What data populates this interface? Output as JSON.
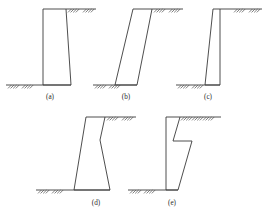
{
  "figure": {
    "background_color": "#ffffff",
    "line_color": "#3a3a3a",
    "hatch_color": "#555555",
    "width": 270,
    "height": 213,
    "panels": [
      {
        "id": "a",
        "label": "(a)",
        "label_x": 50,
        "label_y": 99,
        "description": "Vertical back face with slightly battered front face",
        "wall_points": "43,9 66,9 71,85 43,85",
        "ground_lines": [
          {
            "name": "base-ground-line",
            "x1": 6,
            "y1": 85,
            "x2": 71,
            "y2": 85
          },
          {
            "name": "top-ground-line",
            "x1": 66,
            "y1": 9,
            "x2": 96,
            "y2": 9
          }
        ],
        "hatch_groups": [
          {
            "name": "base-hatch-left",
            "x": 8,
            "y": 85,
            "count": 4,
            "spacing": 2.6,
            "length": 3.4
          },
          {
            "name": "base-hatch-right",
            "x": 22,
            "y": 85,
            "count": 4,
            "spacing": 2.6,
            "length": 3.4
          },
          {
            "name": "top-hatch-left",
            "x": 68,
            "y": 9,
            "count": 4,
            "spacing": 2.6,
            "length": 3.4
          },
          {
            "name": "top-hatch-right",
            "x": 83,
            "y": 9,
            "count": 4,
            "spacing": 2.6,
            "length": 3.4
          }
        ]
      },
      {
        "id": "b",
        "label": "(b)",
        "label_x": 126,
        "label_y": 99,
        "description": "Strongly inclined parallelogram wall leaning forward",
        "wall_points": "133,9 152,9 137,85 115,85",
        "ground_lines": [
          {
            "name": "base-ground-line",
            "x1": 93,
            "y1": 85,
            "x2": 137,
            "y2": 85
          },
          {
            "name": "top-ground-line",
            "x1": 152,
            "y1": 9,
            "x2": 183,
            "y2": 9
          }
        ],
        "hatch_groups": [
          {
            "name": "base-hatch-left",
            "x": 95,
            "y": 85,
            "count": 4,
            "spacing": 2.6,
            "length": 3.4
          },
          {
            "name": "base-hatch-right",
            "x": 109,
            "y": 85,
            "count": 4,
            "spacing": 2.6,
            "length": 3.4
          },
          {
            "name": "top-hatch-left",
            "x": 154,
            "y": 9,
            "count": 4,
            "spacing": 2.6,
            "length": 3.4
          },
          {
            "name": "top-hatch-right",
            "x": 169,
            "y": 9,
            "count": 4,
            "spacing": 2.6,
            "length": 3.4
          }
        ]
      },
      {
        "id": "c",
        "label": "(c)",
        "label_x": 208,
        "label_y": 99,
        "description": "Vertical front face with battered back face",
        "wall_points": "213,9 220,9 220,85 205,85",
        "ground_lines": [
          {
            "name": "base-ground-line",
            "x1": 176,
            "y1": 85,
            "x2": 220,
            "y2": 85
          },
          {
            "name": "top-ground-line",
            "x1": 220,
            "y1": 9,
            "x2": 262,
            "y2": 9
          }
        ],
        "hatch_groups": [
          {
            "name": "base-hatch-left",
            "x": 178,
            "y": 85,
            "count": 4,
            "spacing": 2.6,
            "length": 3.4
          },
          {
            "name": "base-hatch-right",
            "x": 192,
            "y": 85,
            "count": 4,
            "spacing": 2.6,
            "length": 3.4
          },
          {
            "name": "top-hatch-left",
            "x": 234,
            "y": 9,
            "count": 4,
            "spacing": 2.6,
            "length": 3.4
          },
          {
            "name": "top-hatch-right",
            "x": 249,
            "y": 9,
            "count": 4,
            "spacing": 2.6,
            "length": 3.4
          }
        ]
      },
      {
        "id": "d",
        "label": "(d)",
        "label_x": 96,
        "label_y": 205,
        "description": "Battered wall with a break in slope on the front face",
        "wall_points": "86,117 105,117 100,140 110,190 74,190",
        "ground_lines": [
          {
            "name": "base-ground-line",
            "x1": 36,
            "y1": 190,
            "x2": 110,
            "y2": 190
          },
          {
            "name": "top-ground-line",
            "x1": 105,
            "y1": 117,
            "x2": 136,
            "y2": 117
          }
        ],
        "hatch_groups": [
          {
            "name": "base-hatch-left",
            "x": 38,
            "y": 190,
            "count": 4,
            "spacing": 2.6,
            "length": 3.4
          },
          {
            "name": "base-hatch-right",
            "x": 52,
            "y": 190,
            "count": 4,
            "spacing": 2.6,
            "length": 3.4
          },
          {
            "name": "top-hatch-left",
            "x": 107,
            "y": 117,
            "count": 4,
            "spacing": 2.6,
            "length": 3.4
          },
          {
            "name": "top-hatch-right",
            "x": 122,
            "y": 117,
            "count": 4,
            "spacing": 2.6,
            "length": 3.4
          }
        ]
      },
      {
        "id": "e",
        "label": "(e)",
        "label_x": 172,
        "label_y": 205,
        "description": "Stepped wall with a shelf notch on the front face",
        "wall_points": "166,117 180,117 173,141 192,141 178,190 166,190",
        "ground_lines": [
          {
            "name": "base-ground-line",
            "x1": 128,
            "y1": 190,
            "x2": 178,
            "y2": 190
          },
          {
            "name": "top-ground-line",
            "x1": 180,
            "y1": 117,
            "x2": 221,
            "y2": 117
          }
        ],
        "hatch_groups": [
          {
            "name": "base-hatch-left",
            "x": 130,
            "y": 190,
            "count": 4,
            "spacing": 2.6,
            "length": 3.4
          },
          {
            "name": "base-hatch-right",
            "x": 144,
            "y": 190,
            "count": 4,
            "spacing": 2.6,
            "length": 3.4
          },
          {
            "name": "top-hatch-a",
            "x": 181,
            "y": 117,
            "count": 4,
            "spacing": 2.6,
            "length": 3.4
          },
          {
            "name": "top-hatch-b",
            "x": 192,
            "y": 117,
            "count": 4,
            "spacing": 2.6,
            "length": 3.4
          },
          {
            "name": "top-hatch-c",
            "x": 203,
            "y": 117,
            "count": 4,
            "spacing": 2.6,
            "length": 3.4
          }
        ]
      }
    ]
  }
}
